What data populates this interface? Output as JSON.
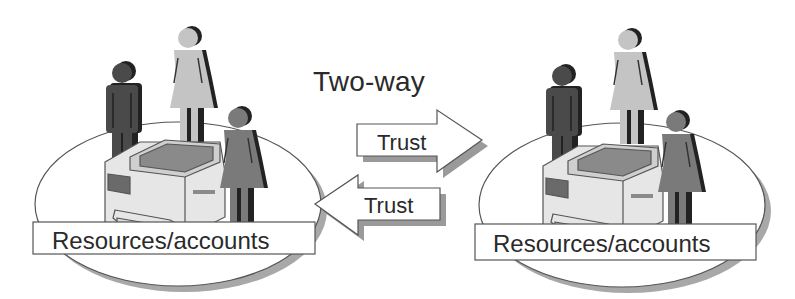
{
  "diagram": {
    "title": "Two-way",
    "arrows": [
      {
        "direction": "right",
        "label": "Trust"
      },
      {
        "direction": "left",
        "label": "Trust"
      }
    ],
    "domains": [
      {
        "position": "left",
        "label": "Resources/accounts",
        "contents": [
          "man",
          "woman",
          "printer",
          "woman"
        ]
      },
      {
        "position": "right",
        "label": "Resources/accounts",
        "contents": [
          "man",
          "woman",
          "printer",
          "woman"
        ]
      }
    ]
  },
  "colors": {
    "background": "#ffffff",
    "outline": "#555555",
    "shadow": "#9a9a9a",
    "dark_figure": "#4a4a4a",
    "light_figure": "#c4c4c4",
    "mid_figure": "#7a7a7a",
    "text": "#2a2a2a"
  }
}
